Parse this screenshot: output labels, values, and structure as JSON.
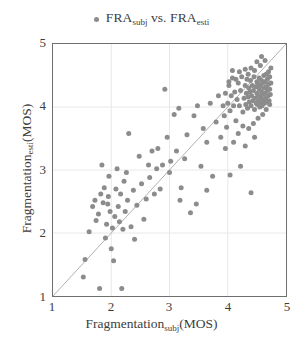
{
  "legend": {
    "marker_name": "legend-dot",
    "prefix": "FRA",
    "sub1": "subj",
    "middle": " vs. FRA",
    "sub2": "esti",
    "full_text": "FRA_subj vs. FRA_esti"
  },
  "axes": {
    "x_title_main": "Fragmentation",
    "x_title_sub": "subj",
    "x_title_unit": "(MOS)",
    "y_title_main": "Fragmentation",
    "y_title_sub": "esti",
    "y_title_unit": "(MOS)",
    "xticks": [
      "1",
      "2",
      "3",
      "4",
      "5"
    ],
    "yticks": [
      "5",
      "4",
      "3",
      "2",
      "1"
    ]
  },
  "colors": {
    "marker": "#8c8c8c",
    "identity_line": "#a8a8a8",
    "gridline": "#e8e8e8",
    "frame": "#6f6f6f",
    "background": "#ffffff",
    "text": "#3d3d3d"
  },
  "chart_data": {
    "type": "scatter",
    "title": "",
    "xlabel": "Fragmentation_subj(MOS)",
    "ylabel": "Fragmentation_esti(MOS)",
    "xlim": [
      1,
      5
    ],
    "ylim": [
      1,
      5
    ],
    "xticks": [
      1,
      2,
      3,
      4,
      5
    ],
    "yticks": [
      1,
      2,
      3,
      4,
      5
    ],
    "grid": true,
    "legend_position": "top-center",
    "legend_entries": [
      "FRA_subj vs. FRA_esti"
    ],
    "reference_line": {
      "type": "identity",
      "from": [
        1,
        1
      ],
      "to": [
        5,
        5
      ],
      "label": "y = x"
    },
    "marker_size_px": 5,
    "series": [
      {
        "name": "FRA_subj vs. FRA_esti",
        "color": "#8c8c8c",
        "points": [
          [
            1.52,
            1.3
          ],
          [
            1.55,
            1.58
          ],
          [
            1.62,
            2.02
          ],
          [
            1.68,
            2.42
          ],
          [
            1.72,
            2.52
          ],
          [
            1.74,
            2.2
          ],
          [
            1.78,
            2.3
          ],
          [
            1.8,
            1.12
          ],
          [
            1.82,
            2.62
          ],
          [
            1.84,
            3.08
          ],
          [
            1.86,
            2.48
          ],
          [
            1.88,
            2.72
          ],
          [
            1.9,
            1.92
          ],
          [
            1.92,
            2.14
          ],
          [
            1.94,
            2.46
          ],
          [
            1.95,
            2.58
          ],
          [
            1.96,
            2.9
          ],
          [
            1.98,
            2.34
          ],
          [
            2.0,
            1.75
          ],
          [
            2.02,
            2.08
          ],
          [
            2.04,
            1.56
          ],
          [
            2.06,
            2.26
          ],
          [
            2.08,
            2.7
          ],
          [
            2.1,
            3.02
          ],
          [
            2.12,
            2.42
          ],
          [
            2.14,
            2.18
          ],
          [
            2.16,
            2.62
          ],
          [
            2.18,
            1.12
          ],
          [
            2.2,
            2.06
          ],
          [
            2.22,
            2.82
          ],
          [
            2.24,
            2.34
          ],
          [
            2.26,
            2.96
          ],
          [
            2.28,
            2.52
          ],
          [
            2.3,
            3.58
          ],
          [
            2.34,
            2.1
          ],
          [
            2.38,
            2.68
          ],
          [
            2.4,
            1.9
          ],
          [
            2.44,
            2.44
          ],
          [
            2.48,
            3.22
          ],
          [
            2.52,
            2.78
          ],
          [
            2.56,
            2.22
          ],
          [
            2.6,
            2.54
          ],
          [
            2.64,
            3.08
          ],
          [
            2.66,
            2.88
          ],
          [
            2.7,
            3.3
          ],
          [
            2.74,
            2.62
          ],
          [
            2.78,
            3.02
          ],
          [
            2.8,
            3.34
          ],
          [
            2.84,
            2.7
          ],
          [
            2.88,
            3.08
          ],
          [
            2.92,
            4.28
          ],
          [
            2.96,
            3.52
          ],
          [
            3.0,
            2.96
          ],
          [
            3.02,
            3.14
          ],
          [
            3.08,
            3.88
          ],
          [
            3.12,
            3.3
          ],
          [
            3.16,
            3.98
          ],
          [
            3.2,
            2.72
          ],
          [
            3.26,
            3.18
          ],
          [
            3.3,
            3.56
          ],
          [
            3.36,
            2.32
          ],
          [
            3.42,
            3.86
          ],
          [
            3.48,
            4.02
          ],
          [
            3.54,
            3.06
          ],
          [
            3.58,
            3.66
          ],
          [
            3.64,
            3.44
          ],
          [
            3.7,
            4.06
          ],
          [
            3.74,
            2.9
          ],
          [
            3.8,
            3.76
          ],
          [
            3.84,
            4.18
          ],
          [
            3.88,
            3.52
          ],
          [
            3.92,
            4.02
          ],
          [
            3.94,
            3.86
          ],
          [
            3.96,
            4.22
          ],
          [
            3.98,
            3.68
          ],
          [
            4.0,
            4.06
          ],
          [
            4.02,
            4.34
          ],
          [
            4.04,
            3.94
          ],
          [
            4.06,
            4.18
          ],
          [
            4.08,
            4.46
          ],
          [
            4.1,
            4.02
          ],
          [
            4.12,
            4.24
          ],
          [
            4.14,
            3.78
          ],
          [
            4.16,
            4.12
          ],
          [
            4.18,
            4.38
          ],
          [
            4.2,
            4.02
          ],
          [
            4.22,
            4.26
          ],
          [
            4.24,
            4.48
          ],
          [
            4.26,
            3.92
          ],
          [
            4.28,
            4.14
          ],
          [
            4.3,
            4.34
          ],
          [
            4.31,
            4.04
          ],
          [
            4.32,
            4.22
          ],
          [
            4.33,
            4.44
          ],
          [
            4.34,
            3.98
          ],
          [
            4.35,
            4.16
          ],
          [
            4.36,
            4.3
          ],
          [
            4.37,
            4.08
          ],
          [
            4.38,
            4.24
          ],
          [
            4.39,
            4.42
          ],
          [
            4.4,
            4.02
          ],
          [
            4.41,
            4.18
          ],
          [
            4.42,
            4.34
          ],
          [
            4.43,
            4.1
          ],
          [
            4.44,
            4.26
          ],
          [
            4.45,
            4.48
          ],
          [
            4.46,
            3.96
          ],
          [
            4.47,
            4.14
          ],
          [
            4.48,
            4.32
          ],
          [
            4.49,
            4.06
          ],
          [
            4.5,
            4.22
          ],
          [
            4.5,
            4.4
          ],
          [
            4.51,
            4.04
          ],
          [
            4.52,
            4.18
          ],
          [
            4.52,
            4.36
          ],
          [
            4.53,
            4.1
          ],
          [
            4.54,
            4.28
          ],
          [
            4.54,
            4.46
          ],
          [
            4.55,
            4.0
          ],
          [
            4.56,
            4.16
          ],
          [
            4.56,
            4.34
          ],
          [
            4.57,
            4.08
          ],
          [
            4.58,
            4.24
          ],
          [
            4.58,
            4.42
          ],
          [
            4.59,
            4.02
          ],
          [
            4.6,
            4.2
          ],
          [
            4.6,
            4.38
          ],
          [
            4.61,
            4.12
          ],
          [
            4.62,
            4.3
          ],
          [
            4.62,
            4.5
          ],
          [
            4.63,
            4.06
          ],
          [
            4.64,
            4.22
          ],
          [
            4.64,
            4.4
          ],
          [
            4.65,
            4.14
          ],
          [
            4.66,
            4.32
          ],
          [
            4.66,
            4.52
          ],
          [
            4.67,
            4.08
          ],
          [
            4.68,
            4.26
          ],
          [
            4.68,
            4.44
          ],
          [
            4.69,
            4.18
          ],
          [
            4.7,
            4.36
          ],
          [
            4.7,
            4.56
          ],
          [
            4.71,
            4.1
          ],
          [
            4.72,
            4.28
          ],
          [
            4.72,
            4.48
          ],
          [
            4.73,
            4.2
          ],
          [
            4.74,
            4.38
          ],
          [
            4.74,
            4.62
          ],
          [
            4.56,
            4.66
          ],
          [
            4.5,
            4.72
          ],
          [
            4.46,
            4.58
          ],
          [
            4.4,
            4.62
          ],
          [
            4.35,
            4.52
          ],
          [
            4.3,
            4.6
          ],
          [
            4.58,
            4.8
          ],
          [
            4.64,
            4.74
          ],
          [
            4.2,
            4.56
          ],
          [
            4.14,
            4.44
          ],
          [
            4.08,
            4.58
          ],
          [
            4.02,
            4.4
          ],
          [
            4.44,
            3.74
          ],
          [
            4.52,
            3.82
          ],
          [
            4.6,
            3.88
          ],
          [
            4.36,
            3.66
          ],
          [
            4.26,
            3.7
          ],
          [
            4.18,
            3.58
          ],
          [
            4.66,
            3.96
          ],
          [
            4.72,
            4.04
          ],
          [
            3.96,
            3.34
          ],
          [
            4.1,
            3.44
          ],
          [
            4.3,
            3.38
          ],
          [
            4.46,
            3.52
          ],
          [
            4.04,
            2.92
          ],
          [
            4.22,
            3.06
          ],
          [
            4.4,
            2.64
          ],
          [
            3.64,
            2.68
          ],
          [
            3.46,
            2.46
          ],
          [
            3.18,
            2.52
          ]
        ]
      }
    ]
  }
}
